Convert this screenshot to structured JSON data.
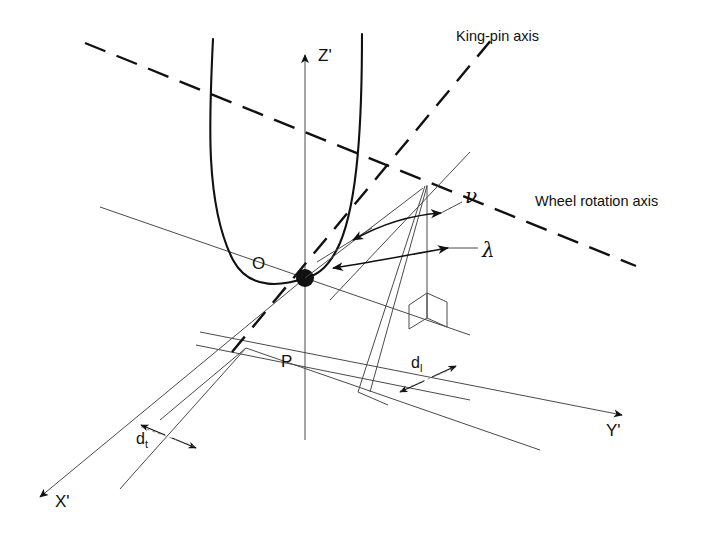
{
  "figure": {
    "type": "engineering-diagram",
    "background_color": "#ffffff",
    "line_color": "#1a1a1a",
    "thin_line_color": "#555555"
  },
  "labels": {
    "king_pin_axis": "King-pin axis",
    "wheel_rotation_axis": "Wheel rotation axis",
    "axis_x": "X'",
    "axis_y": "Y'",
    "axis_z": "Z'",
    "point_o": "O",
    "point_p": "P",
    "angle_nu": "ν",
    "angle_lambda": "λ",
    "dim_dt_base": "d",
    "dim_dt_sub": "t",
    "dim_dl_base": "d",
    "dim_dl_sub": "l"
  },
  "annotations": [
    {
      "name": "king-pin-axis-label",
      "text": "King-pin axis",
      "x": 456,
      "y": 36
    },
    {
      "name": "wheel-rotation-axis-label",
      "text": "Wheel rotation axis",
      "x": 535,
      "y": 201
    },
    {
      "name": "z-axis-label",
      "text": "Z'",
      "x": 318,
      "y": 56
    },
    {
      "name": "x-axis-label",
      "text": "X'",
      "x": 56,
      "y": 503
    },
    {
      "name": "y-axis-label",
      "text": "Y'",
      "x": 607,
      "y": 431
    },
    {
      "name": "point-o-label",
      "text": "O",
      "x": 255,
      "y": 265
    },
    {
      "name": "point-p-label",
      "text": "P",
      "x": 283,
      "y": 362
    },
    {
      "name": "angle-nu-label",
      "text": "ν",
      "x": 446,
      "y": 222
    },
    {
      "name": "angle-lambda-label",
      "text": "λ",
      "x": 475,
      "y": 258
    },
    {
      "name": "dimension-dt-label",
      "text": "dt",
      "x": 139,
      "y": 441
    },
    {
      "name": "dimension-dl-label",
      "text": "dl",
      "x": 413,
      "y": 365
    }
  ],
  "geometry": {
    "origin_o": {
      "x": 305,
      "y": 278
    },
    "point_p": {
      "x": 305,
      "y": 370
    },
    "kingpin_top": {
      "x": 500,
      "y": 30
    },
    "kingpin_bottom": {
      "x": 232,
      "y": 350
    },
    "wheel_axis_start": {
      "x": 85,
      "y": 43
    },
    "wheel_axis_end": {
      "x": 636,
      "y": 266
    },
    "convergence_point": {
      "x": 427,
      "y": 182
    },
    "z_axis_top": {
      "x": 305,
      "y": 50
    },
    "x_axis_tip": {
      "x": 33,
      "y": 501
    },
    "y_axis_tip": {
      "x": 628,
      "y": 418
    }
  }
}
